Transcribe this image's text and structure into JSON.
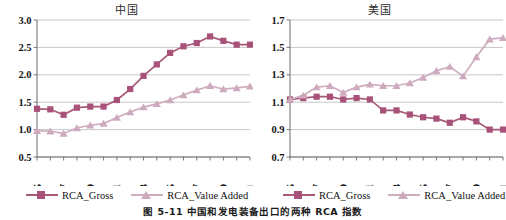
{
  "figure": {
    "caption": "图 5-11  中国和发电装备出口的两种 RCA 指数"
  },
  "legend": {
    "gross_label": "RCA_Gross",
    "value_added_label": "RCA_Value Added",
    "gross_color": "#a8527a",
    "value_added_color": "#ceaabe"
  },
  "chart_data": [
    {
      "type": "line",
      "title": "中国",
      "xlabel": "",
      "ylabel": "",
      "x": [
        1995,
        1996,
        1997,
        1998,
        1999,
        2000,
        2001,
        2002,
        2003,
        2004,
        2005,
        2006,
        2007,
        2008,
        2009,
        2010,
        2011
      ],
      "xtick_labels": [
        "1995",
        "1997",
        "1999",
        "2001",
        "2003",
        "2005",
        "2007",
        "2009",
        "2011"
      ],
      "xtick_values": [
        1995,
        1997,
        1999,
        2001,
        2003,
        2005,
        2007,
        2009,
        2011
      ],
      "ylim": [
        0.5,
        3.0
      ],
      "yticks": [
        0.5,
        1.0,
        1.5,
        2.0,
        2.5,
        3.0
      ],
      "ytick_labels": [
        "0.5",
        "1.0",
        "1.5",
        "2.0",
        "2.5",
        "3.0"
      ],
      "grid": true,
      "legend_position": "bottom",
      "series": [
        {
          "name": "RCA_Gross",
          "marker": "square",
          "color": "#a8527a",
          "values": [
            1.38,
            1.37,
            1.27,
            1.4,
            1.42,
            1.42,
            1.54,
            1.74,
            1.98,
            2.19,
            2.4,
            2.52,
            2.58,
            2.7,
            2.62,
            2.55,
            2.55
          ]
        },
        {
          "name": "RCA_Value Added",
          "marker": "triangle",
          "color": "#ceaabe",
          "values": [
            0.98,
            0.97,
            0.93,
            1.03,
            1.08,
            1.11,
            1.22,
            1.32,
            1.41,
            1.47,
            1.54,
            1.63,
            1.72,
            1.8,
            1.74,
            1.76,
            1.79
          ]
        }
      ]
    },
    {
      "type": "line",
      "title": "美国",
      "xlabel": "",
      "ylabel": "",
      "x": [
        1995,
        1996,
        1997,
        1998,
        1999,
        2000,
        2001,
        2002,
        2003,
        2004,
        2005,
        2006,
        2007,
        2008,
        2009,
        2010,
        2011
      ],
      "xtick_labels": [
        "1995",
        "1997",
        "1999",
        "2001",
        "2003",
        "2005",
        "2007",
        "2009",
        "2011"
      ],
      "xtick_values": [
        1995,
        1997,
        1999,
        2001,
        2003,
        2005,
        2007,
        2009,
        2011
      ],
      "ylim": [
        0.7,
        1.7
      ],
      "yticks": [
        0.7,
        0.9,
        1.1,
        1.3,
        1.5,
        1.7
      ],
      "ytick_labels": [
        "0.7",
        "0.9",
        "1.1",
        "1.3",
        "1.5",
        "1.7"
      ],
      "grid": true,
      "legend_position": "bottom",
      "series": [
        {
          "name": "RCA_Gross",
          "marker": "square",
          "color": "#a8527a",
          "values": [
            1.12,
            1.13,
            1.14,
            1.14,
            1.12,
            1.13,
            1.12,
            1.04,
            1.04,
            1.01,
            0.99,
            0.98,
            0.95,
            0.99,
            0.96,
            0.9,
            0.9
          ]
        },
        {
          "name": "RCA_Value Added",
          "marker": "triangle",
          "color": "#ceaabe",
          "values": [
            1.12,
            1.15,
            1.21,
            1.22,
            1.17,
            1.21,
            1.23,
            1.22,
            1.22,
            1.24,
            1.28,
            1.33,
            1.36,
            1.29,
            1.43,
            1.56,
            1.57
          ]
        }
      ]
    }
  ]
}
